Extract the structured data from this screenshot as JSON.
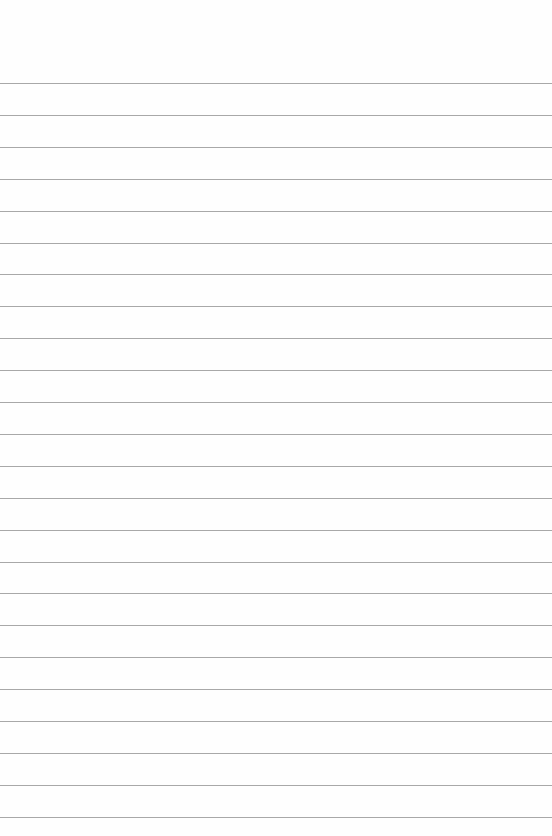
{
  "page": {
    "type": "lined-paper",
    "line_count": 24,
    "first_line_y": 83,
    "line_spacing": 31.9,
    "line_color": "#a8a8a8",
    "background_color": "#fefefe"
  }
}
